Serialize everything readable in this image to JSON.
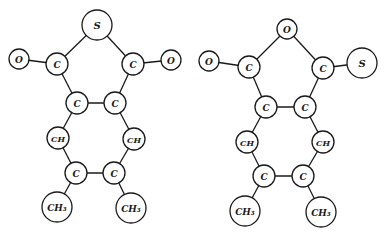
{
  "diagram": {
    "title": "",
    "molecules": [
      {
        "id": "molecule-left",
        "atoms": [
          {
            "id": "S",
            "label": "S",
            "x": 97,
            "y": 25,
            "r": 15,
            "size": 10
          },
          {
            "id": "O1",
            "label": "O",
            "x": 19,
            "y": 59,
            "r": 10,
            "size": 9
          },
          {
            "id": "C1",
            "label": "C",
            "x": 57,
            "y": 64,
            "r": 11,
            "size": 9
          },
          {
            "id": "C2",
            "label": "C",
            "x": 133,
            "y": 64,
            "r": 11,
            "size": 9
          },
          {
            "id": "O2",
            "label": "O",
            "x": 171,
            "y": 60,
            "r": 10,
            "size": 9
          },
          {
            "id": "C3",
            "label": "C",
            "x": 77,
            "y": 103,
            "r": 11,
            "size": 9
          },
          {
            "id": "C4",
            "label": "C",
            "x": 115,
            "y": 103,
            "r": 11,
            "size": 9
          },
          {
            "id": "CH1",
            "label": "CH",
            "x": 58,
            "y": 138,
            "r": 11,
            "size": 8
          },
          {
            "id": "CH2",
            "label": "CH",
            "x": 134,
            "y": 139,
            "r": 11,
            "size": 8
          },
          {
            "id": "C5",
            "label": "C",
            "x": 76,
            "y": 173,
            "r": 11,
            "size": 9
          },
          {
            "id": "C6",
            "label": "C",
            "x": 114,
            "y": 173,
            "r": 11,
            "size": 9
          },
          {
            "id": "M1",
            "label": "CH₃",
            "x": 57,
            "y": 207,
            "r": 15,
            "size": 9
          },
          {
            "id": "M2",
            "label": "CH₃",
            "x": 131,
            "y": 208,
            "r": 15,
            "size": 9
          }
        ],
        "bonds": [
          [
            "S",
            "C1"
          ],
          [
            "S",
            "C2"
          ],
          [
            "O1",
            "C1"
          ],
          [
            "C2",
            "O2"
          ],
          [
            "C1",
            "C3"
          ],
          [
            "C2",
            "C4"
          ],
          [
            "C3",
            "C4"
          ],
          [
            "C3",
            "CH1"
          ],
          [
            "C4",
            "CH2"
          ],
          [
            "CH1",
            "C5"
          ],
          [
            "CH2",
            "C6"
          ],
          [
            "C5",
            "C6"
          ],
          [
            "C5",
            "M1"
          ],
          [
            "C6",
            "M2"
          ]
        ]
      },
      {
        "id": "molecule-right",
        "atoms": [
          {
            "id": "O0",
            "label": "O",
            "x": 287,
            "y": 29,
            "r": 10,
            "size": 9
          },
          {
            "id": "O1",
            "label": "O",
            "x": 209,
            "y": 61,
            "r": 10,
            "size": 9
          },
          {
            "id": "C1",
            "label": "C",
            "x": 249,
            "y": 67,
            "r": 11,
            "size": 9
          },
          {
            "id": "C2",
            "label": "C",
            "x": 323,
            "y": 68,
            "r": 11,
            "size": 9
          },
          {
            "id": "S",
            "label": "S",
            "x": 362,
            "y": 63,
            "r": 15,
            "size": 10
          },
          {
            "id": "C3",
            "label": "C",
            "x": 266,
            "y": 107,
            "r": 11,
            "size": 9
          },
          {
            "id": "C4",
            "label": "C",
            "x": 305,
            "y": 107,
            "r": 11,
            "size": 9
          },
          {
            "id": "CH1",
            "label": "CH",
            "x": 247,
            "y": 142,
            "r": 11,
            "size": 8
          },
          {
            "id": "CH2",
            "label": "CH",
            "x": 323,
            "y": 142,
            "r": 11,
            "size": 8
          },
          {
            "id": "C5",
            "label": "C",
            "x": 264,
            "y": 176,
            "r": 11,
            "size": 9
          },
          {
            "id": "C6",
            "label": "C",
            "x": 303,
            "y": 176,
            "r": 11,
            "size": 9
          },
          {
            "id": "M1",
            "label": "CH₃",
            "x": 245,
            "y": 211,
            "r": 15,
            "size": 9
          },
          {
            "id": "M2",
            "label": "CH₃",
            "x": 321,
            "y": 212,
            "r": 15,
            "size": 9
          }
        ],
        "bonds": [
          [
            "O0",
            "C1"
          ],
          [
            "O0",
            "C2"
          ],
          [
            "O1",
            "C1"
          ],
          [
            "C2",
            "S"
          ],
          [
            "C1",
            "C3"
          ],
          [
            "C2",
            "C4"
          ],
          [
            "C3",
            "C4"
          ],
          [
            "C3",
            "CH1"
          ],
          [
            "C4",
            "CH2"
          ],
          [
            "CH1",
            "C5"
          ],
          [
            "CH2",
            "C6"
          ],
          [
            "C5",
            "C6"
          ],
          [
            "C5",
            "M1"
          ],
          [
            "C6",
            "M2"
          ]
        ]
      }
    ]
  },
  "colors": {
    "line": "#1a1a1a",
    "background": "#ffffff"
  }
}
